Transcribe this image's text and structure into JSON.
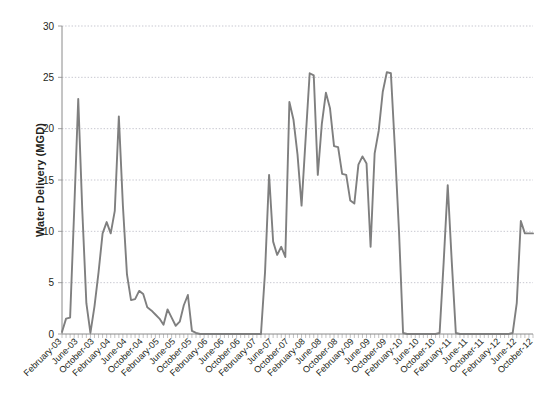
{
  "chart_data": {
    "type": "line",
    "title": "",
    "xlabel": "",
    "ylabel": "Water Delivery (MGD)",
    "ylim": [
      0,
      30
    ],
    "yticks": [
      0,
      5,
      10,
      15,
      20,
      25,
      30
    ],
    "ytick_labels": [
      "0",
      "5",
      "10",
      "15",
      "20",
      "25",
      "30"
    ],
    "grid": true,
    "legend": "none",
    "line_color": "#7f7f7f",
    "axis_color": "#8a8a8a",
    "grid_color": "#b9b9c4",
    "text_color": "#231f20",
    "categories": [
      "February-03",
      "June-03",
      "October-03",
      "February-04",
      "June-04",
      "October-04",
      "February-05",
      "June-05",
      "October-05",
      "February-06",
      "June-06",
      "October-06",
      "February-07",
      "June-07",
      "October-07",
      "February-08",
      "June-08",
      "October-08",
      "February-09",
      "June-09",
      "October-09",
      "February-10",
      "June-10",
      "October-10",
      "February-11",
      "June-11",
      "October-11",
      "February-12",
      "June-12",
      "October-12"
    ],
    "x_tick_labels_rotation_deg": -45,
    "series": [
      {
        "name": "Water Delivery",
        "x": [
          "Feb-03",
          "Mar-03",
          "Apr-03",
          "May-03",
          "Jun-03",
          "Jul-03",
          "Aug-03",
          "Sep-03",
          "Oct-03",
          "Nov-03",
          "Dec-03",
          "Jan-04",
          "Feb-04",
          "Mar-04",
          "Apr-04",
          "May-04",
          "Jun-04",
          "Jul-04",
          "Aug-04",
          "Sep-04",
          "Oct-04",
          "Nov-04",
          "Dec-04",
          "Jan-05",
          "Feb-05",
          "Mar-05",
          "Apr-05",
          "May-05",
          "Jun-05",
          "Jul-05",
          "Aug-05",
          "Sep-05",
          "Oct-05",
          "Nov-05",
          "Dec-05",
          "Jan-06",
          "Feb-06",
          "Mar-06",
          "Apr-06",
          "May-06",
          "Jun-06",
          "Jul-06",
          "Aug-06",
          "Sep-06",
          "Oct-06",
          "Nov-06",
          "Dec-06",
          "Jan-07",
          "Feb-07",
          "Mar-07",
          "Apr-07",
          "May-07",
          "Jun-07",
          "Jul-07",
          "Aug-07",
          "Sep-07",
          "Oct-07",
          "Nov-07",
          "Dec-07",
          "Jan-08",
          "Feb-08",
          "Mar-08",
          "Apr-08",
          "May-08",
          "Jun-08",
          "Jul-08",
          "Aug-08",
          "Sep-08",
          "Oct-08",
          "Nov-08",
          "Dec-08",
          "Jan-09",
          "Feb-09",
          "Mar-09",
          "Apr-09",
          "May-09",
          "Jun-09",
          "Jul-09",
          "Aug-09",
          "Sep-09",
          "Oct-09",
          "Nov-09",
          "Dec-09",
          "Jan-10",
          "Feb-10",
          "Mar-10",
          "Apr-10",
          "May-10",
          "Jun-10",
          "Jul-10",
          "Aug-10",
          "Sep-10",
          "Oct-10",
          "Nov-10",
          "Dec-10",
          "Jan-11",
          "Feb-11",
          "Mar-11",
          "Apr-11",
          "May-11",
          "Jun-11",
          "Jul-11",
          "Aug-11",
          "Sep-11",
          "Oct-11",
          "Nov-11",
          "Dec-11",
          "Jan-12",
          "Feb-12",
          "Mar-12",
          "Apr-12",
          "May-12",
          "Jun-12",
          "Jul-12",
          "Aug-12",
          "Sep-12",
          "Oct-12"
        ],
        "values": [
          0.2,
          1.5,
          1.6,
          12.0,
          22.9,
          12.0,
          3.0,
          0.1,
          2.7,
          6.0,
          9.8,
          10.9,
          9.8,
          12.0,
          21.2,
          12.5,
          5.8,
          3.3,
          3.4,
          4.2,
          3.9,
          2.6,
          2.3,
          1.9,
          1.5,
          0.9,
          2.4,
          1.6,
          0.8,
          1.2,
          2.8,
          3.8,
          0.3,
          0.1,
          0.0,
          0.0,
          0.0,
          0.0,
          0.0,
          0.0,
          0.0,
          0.0,
          0.0,
          0.0,
          0.0,
          0.0,
          0.0,
          0.0,
          0.0,
          0.0,
          6.0,
          15.5,
          9.0,
          7.7,
          8.5,
          7.5,
          22.6,
          20.9,
          17.5,
          12.5,
          19.0,
          25.4,
          25.2,
          15.5,
          20.5,
          23.5,
          22.0,
          18.3,
          18.2,
          15.6,
          15.5,
          13.0,
          12.7,
          16.5,
          17.3,
          16.6,
          8.5,
          17.6,
          19.8,
          23.6,
          25.5,
          25.4,
          18.0,
          10.0,
          0.1,
          0.0,
          0.0,
          0.0,
          0.0,
          0.0,
          0.0,
          0.0,
          0.0,
          0.1,
          7.0,
          14.5,
          7.0,
          0.1,
          0.0,
          0.0,
          0.0,
          0.0,
          0.0,
          0.0,
          0.0,
          0.0,
          0.0,
          0.0,
          0.0,
          0.0,
          0.0,
          0.1,
          3.0,
          11.0,
          9.8,
          9.8,
          9.8
        ]
      }
    ]
  },
  "axis": {
    "y_title": "Water Delivery (MGD)"
  }
}
